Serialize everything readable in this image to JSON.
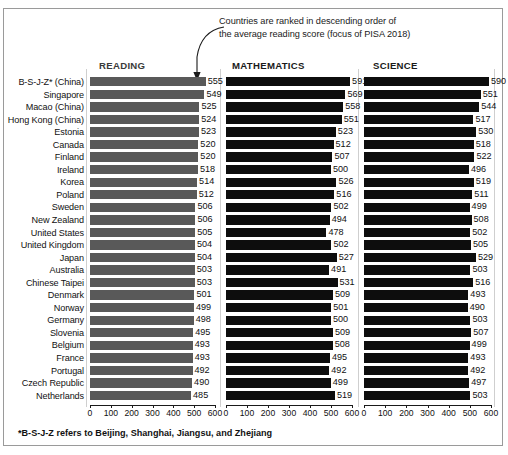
{
  "annotation": {
    "line1": "Countries are ranked in descending order of",
    "line2": "the average reading score (focus of PISA 2018)"
  },
  "footnote": "*B-S-J-Z refers to Beijing, Shanghai, Jiangsu, and Zhejiang",
  "headers": {
    "reading": "READING",
    "mathematics": "MATHEMATICS",
    "science": "SCIENCE"
  },
  "axis": {
    "ticks": [
      0,
      100,
      200,
      300,
      400,
      500,
      600
    ],
    "tick_labels": [
      "0",
      "100",
      "200",
      "300",
      "400",
      "500",
      "600"
    ],
    "min": 0,
    "max": 600
  },
  "colors": {
    "reading_bar": "#595959",
    "math_bar": "#0d0d0d",
    "science_bar": "#0d0d0d",
    "border": "#9a9a9a",
    "text": "#111111"
  },
  "chart_data": {
    "type": "bar",
    "title": "",
    "subtitle": "Countries are ranked in descending order of the average reading score (focus of PISA 2018)",
    "xlabel": "",
    "ylabel": "",
    "xlim": [
      0,
      600
    ],
    "grid": false,
    "orientation": "horizontal",
    "legend": "none",
    "panels": [
      "READING",
      "MATHEMATICS",
      "SCIENCE"
    ],
    "categories": [
      "B-S-J-Z* (China)",
      "Singapore",
      "Macao (China)",
      "Hong Kong (China)",
      "Estonia",
      "Canada",
      "Finland",
      "Ireland",
      "Korea",
      "Poland",
      "Sweden",
      "New Zealand",
      "United States",
      "United Kingdom",
      "Japan",
      "Australia",
      "Chinese Taipei",
      "Denmark",
      "Norway",
      "Germany",
      "Slovenia",
      "Belgium",
      "France",
      "Portugal",
      "Czech Republic",
      "Netherlands"
    ],
    "series": [
      {
        "name": "READING",
        "values": [
          555,
          549,
          525,
          524,
          523,
          520,
          520,
          518,
          514,
          512,
          506,
          506,
          505,
          504,
          504,
          503,
          503,
          501,
          499,
          498,
          495,
          493,
          493,
          492,
          490,
          485
        ]
      },
      {
        "name": "MATHEMATICS",
        "values": [
          591,
          569,
          558,
          551,
          523,
          512,
          507,
          500,
          526,
          516,
          502,
          494,
          478,
          502,
          527,
          491,
          531,
          509,
          501,
          500,
          509,
          508,
          495,
          492,
          499,
          519
        ]
      },
      {
        "name": "SCIENCE",
        "values": [
          590,
          551,
          544,
          517,
          530,
          518,
          522,
          496,
          519,
          511,
          499,
          508,
          502,
          505,
          529,
          503,
          516,
          493,
          490,
          503,
          507,
          499,
          493,
          492,
          497,
          503
        ]
      }
    ]
  }
}
